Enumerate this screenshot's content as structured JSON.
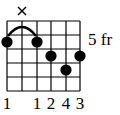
{
  "chord": {
    "fret_position_label": "5 fr",
    "strings": 6,
    "frets_shown": 5,
    "muted_strings": [
      2
    ],
    "muted_symbol": "×",
    "barre": {
      "fret": 1,
      "from_string": 1,
      "to_string": 3
    },
    "dots": [
      {
        "string": 1,
        "fret": 1
      },
      {
        "string": 3,
        "fret": 1
      },
      {
        "string": 4,
        "fret": 2
      },
      {
        "string": 5,
        "fret": 3
      },
      {
        "string": 6,
        "fret": 2
      }
    ],
    "fingers": [
      "1",
      "",
      "1",
      "2",
      "4",
      "3"
    ],
    "colors": {
      "line": "#000000",
      "dot": "#000000",
      "background": "#ffffff"
    }
  }
}
